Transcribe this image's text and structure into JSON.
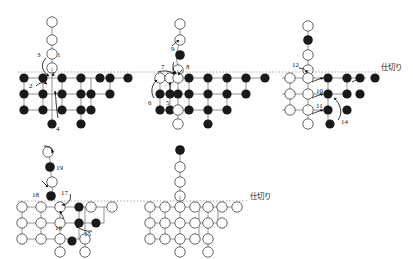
{
  "figure": {
    "title": "",
    "background_color": "#ffffff",
    "node_fill_open": "#ffffff",
    "node_fill_filled": "#1a1a1a",
    "node_stroke": "#555555",
    "edge_color": "#777777",
    "divider_color": "#999999",
    "arrow_color": "#111111"
  },
  "labels": {
    "divider_right_top": "仕切り",
    "divider_right_bottom": "仕切り"
  },
  "panels": [
    {
      "id": "panel-top-left",
      "origin": [
        18,
        8
      ],
      "divider_y": 72,
      "divider_x_start": 18,
      "divider_x_end": 413,
      "tail": {
        "x": 100,
        "nodes": [
          {
            "cy": 22,
            "state": "open"
          },
          {
            "cy": 36,
            "state": "open"
          },
          {
            "cy": 50,
            "state": "open"
          },
          {
            "cy": 64,
            "state": "open"
          }
        ]
      },
      "grid": {
        "x0": 24,
        "dx": 19,
        "y0": 78,
        "dy": 16,
        "rows": [
          {
            "cols": 7,
            "state": "filled"
          },
          {
            "cols": 6,
            "state": "filled"
          },
          {
            "cols": 5,
            "state": "filled"
          }
        ]
      },
      "pendants": [
        {
          "cx": 100,
          "cy": 123,
          "state": "filled"
        },
        {
          "cx": 138,
          "cy": 123,
          "state": "filled"
        }
      ],
      "annotations": [
        {
          "text": "1",
          "x": 108,
          "y": 66
        },
        {
          "text": "3",
          "x": 82,
          "y": 64
        },
        {
          "text": "2",
          "x": 54,
          "y": 87
        },
        {
          "text": "4",
          "x": 104,
          "y": 124
        }
      ]
    },
    {
      "id": "panel-top-middle",
      "origin": [
        150,
        8
      ],
      "divider_y": 72,
      "divider_x_start": 150,
      "divider_x_end": 413,
      "tail": {
        "x": 232,
        "nodes": [
          {
            "cy": 22,
            "state": "open"
          },
          {
            "cy": 38,
            "state": "open"
          },
          {
            "cy": 52,
            "state": "filled"
          },
          {
            "cy": 66,
            "state": "open"
          }
        ]
      },
      "grid": {
        "x0": 156,
        "dx": 19,
        "y0": 78,
        "dy": 16,
        "rows": [
          {
            "cols": 8,
            "state": "mixed"
          },
          {
            "cols": 7,
            "state": "mixed"
          },
          {
            "cols": 6,
            "state": "mixed"
          }
        ]
      },
      "pendants": [
        {
          "cx": 232,
          "cy": 123,
          "state": "open"
        },
        {
          "cx": 270,
          "cy": 123,
          "state": "filled"
        }
      ],
      "annotations": [
        {
          "text": "9",
          "x": 220,
          "y": 52
        },
        {
          "text": "7",
          "x": 184,
          "y": 66
        },
        {
          "text": "8",
          "x": 240,
          "y": 68
        },
        {
          "text": "6",
          "x": 154,
          "y": 99
        },
        {
          "text": "5",
          "x": 174,
          "y": 100
        }
      ]
    },
    {
      "id": "panel-top-right",
      "origin": [
        288,
        8
      ],
      "divider_y": 72,
      "divider_x_start": 288,
      "divider_x_end": 380,
      "tail": {
        "x": 318,
        "nodes": [
          {
            "cy": 26,
            "state": "open"
          },
          {
            "cy": 40,
            "state": "filled"
          },
          {
            "cy": 54,
            "state": "open"
          },
          {
            "cy": 68,
            "state": "open"
          }
        ]
      },
      "grid": {
        "x0": 284,
        "dx": 19,
        "y0": 78,
        "dy": 16,
        "rows": [
          {
            "cols": 7,
            "state": "mixed"
          },
          {
            "cols": 6,
            "state": "mixed"
          },
          {
            "cols": 5,
            "state": "mixed"
          }
        ]
      },
      "pendants": [
        {
          "cx": 318,
          "cy": 123,
          "state": "open"
        },
        {
          "cx": 337,
          "cy": 120,
          "state": "filled"
        }
      ],
      "annotations": [
        {
          "text": "12",
          "x": 300,
          "y": 67
        },
        {
          "text": "10",
          "x": 330,
          "y": 90
        },
        {
          "text": "13",
          "x": 362,
          "y": 93
        },
        {
          "text": "11",
          "x": 330,
          "y": 105
        },
        {
          "text": "14",
          "x": 345,
          "y": 122
        }
      ]
    },
    {
      "id": "panel-bottom-left",
      "origin": [
        18,
        138
      ],
      "divider_y": 201,
      "divider_x_start": 18,
      "divider_x_end": 413,
      "tail": {
        "x": 62,
        "nodes": [
          {
            "cy": 152,
            "state": "open"
          },
          {
            "cy": 167,
            "state": "filled"
          },
          {
            "cy": 181,
            "state": "open"
          },
          {
            "cy": 195,
            "state": "filled"
          }
        ]
      },
      "grid": {
        "x0": 24,
        "dx": 19,
        "y0": 207,
        "dy": 16,
        "rows": [
          {
            "cols": 7,
            "state": "mixed"
          },
          {
            "cols": 6,
            "state": "mixed"
          },
          {
            "cols": 5,
            "state": "mixed"
          }
        ]
      },
      "pendants": [
        {
          "cx": 62,
          "cy": 252,
          "state": "open"
        },
        {
          "cx": 100,
          "cy": 252,
          "state": "open"
        }
      ],
      "annotations": [
        {
          "text": "19",
          "x": 68,
          "y": 166
        },
        {
          "text": "18",
          "x": 40,
          "y": 192
        },
        {
          "text": "17",
          "x": 68,
          "y": 190
        },
        {
          "text": "16",
          "x": 60,
          "y": 226
        },
        {
          "text": "15",
          "x": 90,
          "y": 230
        }
      ]
    },
    {
      "id": "panel-bottom-right",
      "origin": [
        150,
        138
      ],
      "divider_y": 201,
      "divider_x_start": 150,
      "divider_x_end": 250,
      "tail": {
        "x": 180,
        "nodes": [
          {
            "cy": 150,
            "state": "filled"
          },
          {
            "cy": 166,
            "state": "open"
          },
          {
            "cy": 180,
            "state": "open"
          },
          {
            "cy": 194,
            "state": "open"
          }
        ]
      },
      "grid": {
        "x0": 150,
        "dx": 19,
        "y0": 207,
        "dy": 16,
        "rows": [
          {
            "cols": 7,
            "state": "open"
          },
          {
            "cols": 6,
            "state": "open"
          },
          {
            "cols": 5,
            "state": "open"
          }
        ]
      },
      "pendants": [
        {
          "cx": 180,
          "cy": 252,
          "state": "open"
        },
        {
          "cx": 218,
          "cy": 252,
          "state": "open"
        }
      ],
      "annotations": []
    }
  ]
}
